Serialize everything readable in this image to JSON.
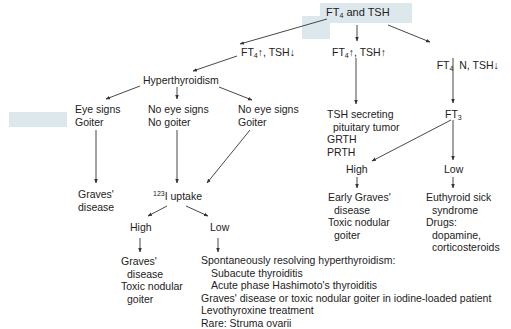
{
  "diagram": {
    "colors": {
      "text": "#222222",
      "lines": "#333333",
      "highlight": "#dde8ec"
    },
    "root": {
      "label_pre": "FT",
      "label_sub": "4",
      "label_post": " and TSH"
    },
    "branch_a": {
      "pre": "FT",
      "sub": "4",
      "post": "↑, TSH↓"
    },
    "branch_b": {
      "pre": "FT",
      "sub": "4",
      "post": "↑, TSH↑"
    },
    "branch_c": {
      "pre": "FT",
      "sub": "4",
      "post": "  N, TSH↓"
    },
    "hyperthyroidism": "Hyperthyroidism",
    "eye_goiter": [
      "Eye signs",
      "Goiter"
    ],
    "noeye_nogoiter": [
      "No eye signs",
      "No goiter"
    ],
    "noeye_goiter": [
      "No eye signs",
      "Goiter"
    ],
    "graves_left": [
      "Graves'",
      "disease"
    ],
    "uptake": {
      "sup": "123",
      "post": "I uptake"
    },
    "uptake_high": "High",
    "uptake_low": "Low",
    "uptake_high_result": [
      "Graves'",
      "disease",
      "Toxic nodular",
      "goiter"
    ],
    "uptake_low_result": {
      "heading": "Spontaneously resolving hyperthyroidism:",
      "sub_items": [
        "Subacute thyroiditis",
        "Acute phase Hashimoto's thyroiditis"
      ],
      "items": [
        "Graves' disease or toxic nodular goiter in iodine-loaded patient",
        "Levothyroxine treatment",
        "Rare: Struma ovarii"
      ]
    },
    "tsh_high_causes": [
      "TSH secreting",
      "pituitary tumor",
      "GRTH",
      "PRTH"
    ],
    "ft3": {
      "pre": "FT",
      "sub": "3"
    },
    "ft3_high": "High",
    "ft3_low": "Low",
    "ft3_high_result": [
      "Early Graves'",
      "disease",
      "Toxic nodular",
      "goiter"
    ],
    "ft3_low_result": [
      "Euthyroid sick",
      "syndrome",
      "Drugs:",
      "dopamine,",
      "corticosteroids"
    ]
  }
}
